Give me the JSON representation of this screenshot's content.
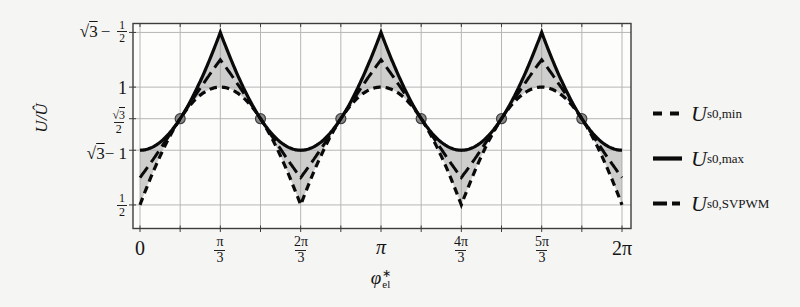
{
  "figure": {
    "background": "#f5f5f3",
    "y_axis_label": {
      "text": "U/Û"
    },
    "x_axis_label": {
      "symbol": "φ",
      "sup": "∗",
      "sub": "el"
    },
    "y_tick_labels": {
      "t0": {
        "sqrt": "√",
        "arg": "3",
        "minus": "−",
        "num": "1",
        "den": "2"
      },
      "t1": {
        "text": "1"
      },
      "t2": {
        "num_sqrt": "√",
        "num_arg": "3",
        "den": "2"
      },
      "t3": {
        "sqrt": "√",
        "arg": "3",
        "post": " − 1"
      },
      "t4": {
        "num": "1",
        "den": "2"
      }
    },
    "x_tick_labels": {
      "t0": {
        "text": "0"
      },
      "t1": {
        "num": "π",
        "den": "3"
      },
      "t2": {
        "num": "2π",
        "den": "3"
      },
      "t3": {
        "text": "π"
      },
      "t4": {
        "num": "4π",
        "den": "3"
      },
      "t5": {
        "num": "5π",
        "den": "3"
      },
      "t6": {
        "text": "2π"
      }
    },
    "legend": [
      {
        "symbol": "U",
        "subscript": "s0,min",
        "line_style": "short-dash"
      },
      {
        "symbol": "U",
        "subscript": "s0,max",
        "line_style": "solid"
      },
      {
        "symbol": "U",
        "subscript": "s0,SVPWM",
        "line_style": "long-dash"
      }
    ]
  },
  "chart_data": {
    "type": "line",
    "xlabel": "φ∗el (electrical angle, rad)",
    "ylabel": "U/Û",
    "x_range_over_pi": [
      0,
      2
    ],
    "ylim": [
      0.4,
      1.27
    ],
    "grid": true,
    "x_grid_step_over_pi": 0.16667,
    "x_ticks": [
      {
        "pos_over_pi": 0,
        "label": "0"
      },
      {
        "pos_over_pi": 0.33333,
        "label": "π/3"
      },
      {
        "pos_over_pi": 0.66667,
        "label": "2π/3"
      },
      {
        "pos_over_pi": 1,
        "label": "π"
      },
      {
        "pos_over_pi": 1.33333,
        "label": "4π/3"
      },
      {
        "pos_over_pi": 1.66667,
        "label": "5π/3"
      },
      {
        "pos_over_pi": 2,
        "label": "2π"
      }
    ],
    "y_ticks": [
      {
        "value": 1.2321,
        "label": "√3 − 1/2"
      },
      {
        "value": 1.0,
        "label": "1"
      },
      {
        "value": 0.866,
        "label": "√3/2"
      },
      {
        "value": 0.7321,
        "label": "√3 − 1"
      },
      {
        "value": 0.5,
        "label": "1/2"
      }
    ],
    "samples": 480,
    "series": [
      {
        "name": "U s0,min",
        "formula_id": "u_min",
        "dash": "short",
        "width": 3.2,
        "color": "#0a0a0a",
        "description": "cos((φ − π/3) wrapped to [−π/3, π/3]); period 2π/3; rounded maxima, sharp minima",
        "max": 1.0,
        "max_at_over_pi": [
          0.33333,
          1,
          1.66667
        ],
        "min": 0.5,
        "min_at_over_pi": [
          0,
          0.66667,
          1.33333,
          2
        ]
      },
      {
        "name": "U s0,max",
        "formula_id": "u_max",
        "dash": "solid",
        "width": 3.2,
        "color": "#0a0a0a",
        "description": "√3 − cos(φ wrapped to [−π/3, π/3]); period 2π/3; sharp maxima, rounded minima",
        "max": 1.2321,
        "max_at_over_pi": [
          0.33333,
          1,
          1.66667
        ],
        "min": 0.7321,
        "min_at_over_pi": [
          0,
          0.66667,
          1.33333,
          2
        ]
      },
      {
        "name": "U s0,SVPWM",
        "formula_id": "u_svpwm",
        "dash": "long",
        "width": 3.0,
        "color": "#0a0a0a",
        "description": "(U s0,min + U s0,max)/2; sharp corners at both maxima and minima",
        "max": 1.1161,
        "max_at_over_pi": [
          0.33333,
          1,
          1.66667
        ],
        "min": 0.6161,
        "min_at_over_pi": [
          0,
          0.66667,
          1.33333,
          2
        ]
      }
    ],
    "fill_between": {
      "upper": "U s0,max",
      "lower": "U s0,min",
      "color": "#a0a0a0",
      "opacity": 0.5
    },
    "markers": {
      "shape": "circle",
      "radius_px": 5,
      "fill": "#8a8a8a",
      "stroke": "#3f3f3f",
      "y_value": 0.866,
      "x_over_pi": [
        0.16667,
        0.5,
        0.83333,
        1.16667,
        1.5,
        1.83333
      ],
      "meaning": "intersection points of all three curves at U/Û = √3/2"
    },
    "legend_position": "right-outside"
  }
}
